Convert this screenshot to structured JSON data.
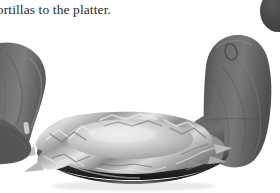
{
  "page": {
    "background_color": "#ffffff",
    "width": 280,
    "height": 193,
    "kind": "scanned-cookbook-page-fragment"
  },
  "caption": {
    "text": "tortillas to the platter.",
    "truncated_left": true,
    "color": "#2b2b2b"
  },
  "photo": {
    "alt": "Two gray oven-mitted hands holding a round metal platter covered with crinkled aluminum foil",
    "style": "grayscale photograph",
    "background_color": "#ffffff",
    "objects": {
      "left_mitt": {
        "name": "oven-mitt-left",
        "color": "#6e6e6e",
        "shadow_color": "#4a4a4a"
      },
      "right_mitt": {
        "name": "oven-mitt-right",
        "color": "#666666",
        "shadow_color": "#454545"
      },
      "platter": {
        "name": "metal-platter",
        "rim_color": "#3a3a3a",
        "surface_color": "#9a9a9a"
      },
      "foil": {
        "name": "aluminum-foil-cover",
        "highlight_color": "#e2e2e2",
        "midtone_color": "#b4b4b4",
        "shadow_color": "#707070"
      }
    }
  },
  "corner_blob": {
    "name": "dark-blob-top-right",
    "color": "#474747"
  },
  "faint_mark": {
    "text": "·  ·  ·",
    "color": "#f2f2f2"
  }
}
